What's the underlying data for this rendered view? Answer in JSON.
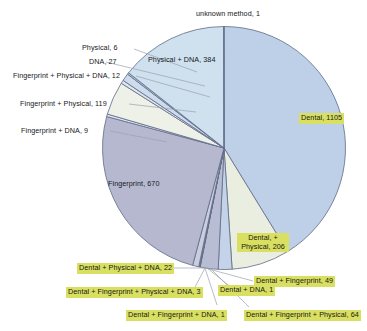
{
  "chart_data": {
    "type": "pie",
    "title": "",
    "xlabel": "",
    "ylabel": "",
    "legend_position": "none",
    "grid": false,
    "total": 2679,
    "categories": [
      "Dental",
      "Dental, + Physical",
      "Dental + Fingerprint",
      "Dental + Fingerprint + Physical",
      "Dental + DNA",
      "Dental + Fingerprint + DNA",
      "Dental + Fingerprint + Physical + DNA",
      "Dental + Physical + DNA",
      "Fingerprint",
      "Fingerprint + DNA",
      "Fingerprint + Physical",
      "Fingerprint + Physical + DNA",
      "DNA",
      "Physical",
      "Physical + DNA",
      "unknown method"
    ],
    "values": [
      1105,
      206,
      49,
      64,
      1,
      1,
      3,
      22,
      670,
      9,
      119,
      12,
      27,
      6,
      384,
      1
    ],
    "colors": [
      "#bed0e7",
      "#e9eee1",
      "#c4d3e8",
      "#b9bdd4",
      "#e9eee1",
      "#c4d3e8",
      "#b9bdd4",
      "#c9cddc",
      "#b6b8cf",
      "#dfe6ef",
      "#eef1e8",
      "#dfe6ef",
      "#cddcec",
      "#b9c6dd",
      "#cfe0ee",
      "#9fb4d0"
    ],
    "slice_labels": [
      {
        "text": "Dental, 1105",
        "highlight": true
      },
      {
        "text": "Dental, + Physical, 206",
        "highlight": true
      },
      {
        "text": "Dental + Fingerprint, 49",
        "highlight": true
      },
      {
        "text": "Dental + Fingerprint + Physical, 64",
        "highlight": true
      },
      {
        "text": "Dental + DNA, 1",
        "highlight": true
      },
      {
        "text": "Dental + Fingerprint + DNA, 1",
        "highlight": true
      },
      {
        "text": "Dental + Fingerprint + Physical + DNA, 3",
        "highlight": true
      },
      {
        "text": "Dental + Physical + DNA, 22",
        "highlight": true
      },
      {
        "text": "Fingerprint, 670",
        "highlight": false
      },
      {
        "text": "Fingerprint + DNA, 9",
        "highlight": false
      },
      {
        "text": "Fingerprint + Physical, 119",
        "highlight": false
      },
      {
        "text": "Fingerprint + Physical + DNA, 12",
        "highlight": false
      },
      {
        "text": "DNA, 27",
        "highlight": false
      },
      {
        "text": "Physical, 6",
        "highlight": false
      },
      {
        "text": "Physical + DNA, 384",
        "highlight": false
      },
      {
        "text": "unknown method, 1",
        "highlight": false
      }
    ]
  },
  "labels": {
    "unknown_method": "unknown method, 1",
    "physical_dna": "Physical + DNA, 384",
    "physical": "Physical, 6",
    "dna": "DNA, 27",
    "fingerprint_physical_dna": "Fingerprint + Physical + DNA, 12",
    "fingerprint_physical": "Fingerprint + Physical, 119",
    "fingerprint_dna": "Fingerprint + DNA, 9",
    "fingerprint": "Fingerprint, 670",
    "dental": "Dental, 1105",
    "dental_physical_l1": "Dental, +",
    "dental_physical_l2": "Physical, 206",
    "dental_fingerprint": "Dental + Fingerprint, 49",
    "dental_physical_dna": "Dental + Physical + DNA, 22",
    "dental_fingerprint_physical_dna": "Dental + Fingerprint + Physical + DNA, 3",
    "dental_fingerprint_dna": "Dental + Fingerprint + DNA, 1",
    "dental_dna": "Dental + DNA, 1",
    "dental_fingerprint_physical": "Dental + Fingerprint + Physical, 64"
  },
  "style": {
    "highlight_color": "#d9df60",
    "stroke_color": "#5f6b86",
    "leader_color": "#9aa2ae"
  }
}
